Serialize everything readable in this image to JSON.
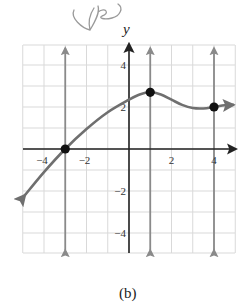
{
  "annotation": {
    "handwritten_text": "yes"
  },
  "caption": "(b)",
  "chart_data": {
    "type": "line",
    "title": "",
    "xlabel": "",
    "ylabel": "y",
    "xlim": [
      -5,
      5
    ],
    "ylim": [
      -5,
      5
    ],
    "grid": true,
    "x_ticks": [
      -4,
      -2,
      2,
      4
    ],
    "x_tick_labels": [
      "−4",
      "−2",
      "2",
      "4"
    ],
    "y_ticks": [
      4,
      2,
      -2,
      -4
    ],
    "y_tick_labels": [
      "4",
      "2",
      "−2",
      "−4"
    ],
    "series": [
      {
        "name": "f(x)",
        "x": [
          -4.9,
          -4,
          -3,
          -2,
          -1,
          0,
          0.5,
          1,
          1.5,
          2,
          2.5,
          3,
          3.5,
          4,
          4.5,
          4.9
        ],
        "y": [
          -2.2,
          -1.1,
          0,
          0.95,
          1.75,
          2.35,
          2.6,
          2.7,
          2.6,
          2.35,
          2.1,
          1.95,
          1.93,
          2.0,
          2.08,
          2.1
        ],
        "arrows_at_ends": true,
        "color": "#6f6f6f"
      }
    ],
    "highlighted_points": [
      {
        "x": -3,
        "y": 0
      },
      {
        "x": 1,
        "y": 2.7
      },
      {
        "x": 4,
        "y": 2
      }
    ],
    "vertical_reference_lines": [
      {
        "x": -3,
        "arrows": "both",
        "color": "#8a8a8a"
      },
      {
        "x": 1,
        "arrows": "both",
        "color": "#8a8a8a"
      },
      {
        "x": 4,
        "arrows": "both",
        "color": "#8a8a8a"
      }
    ],
    "colors": {
      "axis": "#222222",
      "grid": "#d9d9d9",
      "curve": "#6f6f6f",
      "points": "#111111"
    }
  }
}
